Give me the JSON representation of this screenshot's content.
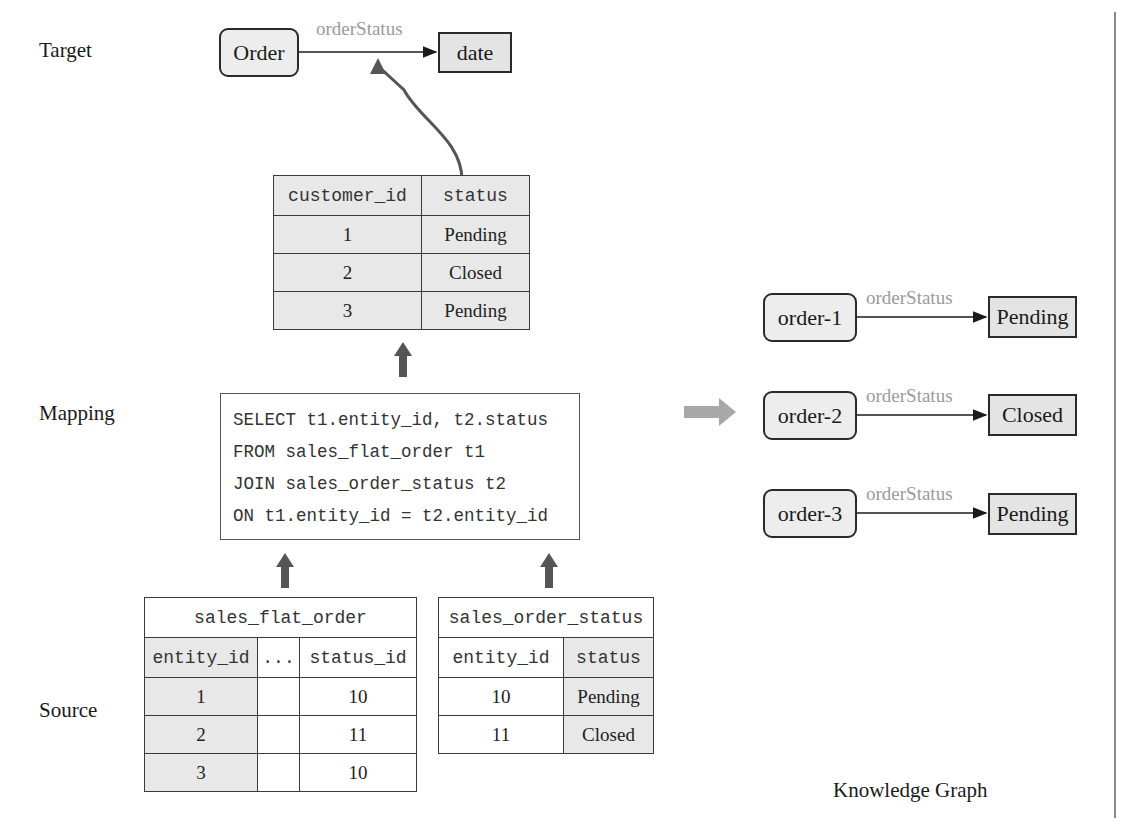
{
  "sections": {
    "target": "Target",
    "mapping": "Mapping",
    "source": "Source",
    "knowledge_graph": "Knowledge Graph"
  },
  "target_schema": {
    "subject": "Order",
    "predicate": "orderStatus",
    "object": "date"
  },
  "result_table": {
    "headers": [
      "customer_id",
      "status"
    ],
    "rows": [
      [
        "1",
        "Pending"
      ],
      [
        "2",
        "Closed"
      ],
      [
        "3",
        "Pending"
      ]
    ]
  },
  "mapping_sql": {
    "lines": [
      "SELECT t1.entity_id, t2.status",
      "FROM sales_flat_order t1",
      "JOIN sales_order_status t2",
      "ON t1.entity_id = t2.entity_id"
    ]
  },
  "source_tables": {
    "sales_flat_order": {
      "title": "sales_flat_order",
      "headers": [
        "entity_id",
        "...",
        "status_id"
      ],
      "rows": [
        [
          "1",
          "",
          "10"
        ],
        [
          "2",
          "",
          "11"
        ],
        [
          "3",
          "",
          "10"
        ]
      ]
    },
    "sales_order_status": {
      "title": "sales_order_status",
      "headers": [
        "entity_id",
        "status"
      ],
      "rows": [
        [
          "10",
          "Pending"
        ],
        [
          "11",
          "Closed"
        ]
      ]
    }
  },
  "knowledge_graph": {
    "triples": [
      {
        "subject": "order-1",
        "predicate": "orderStatus",
        "object": "Pending"
      },
      {
        "subject": "order-2",
        "predicate": "orderStatus",
        "object": "Closed"
      },
      {
        "subject": "order-3",
        "predicate": "orderStatus",
        "object": "Pending"
      }
    ]
  },
  "colors": {
    "arrow_dark": "#555555",
    "arrow_light": "#a8a8a8",
    "edge_label": "#9a9a9a",
    "cell_shade": "#e8e8e8",
    "node_fill": "#ededed"
  }
}
